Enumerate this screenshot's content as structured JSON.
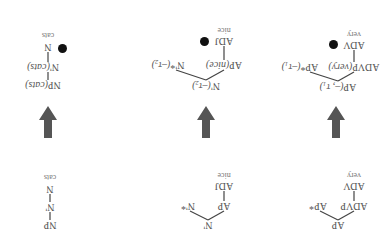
{
  "orientation": "rotated-180",
  "colors": {
    "arrow": "#555555",
    "dot": "#111111",
    "text": "#555555",
    "line": "#444444"
  },
  "top_row": {
    "tree_ap": {
      "root": "AP",
      "left": "ADVP",
      "right": "AP*",
      "mid": "ADV",
      "leaf": "very"
    },
    "tree_nbar": {
      "root": "N'",
      "left": "AP",
      "right": "N'*",
      "mid": "ADJ",
      "leaf": "nice"
    },
    "tree_np": {
      "root": "NP",
      "mid1": "N'",
      "mid2": "N",
      "leaf": "cats"
    }
  },
  "arrows": [
    {
      "direction": "down"
    },
    {
      "direction": "down"
    },
    {
      "direction": "down"
    }
  ],
  "bottom_row": {
    "tree_ap": {
      "root": "AP",
      "root_arg": "(–, τ₁)",
      "left": "ADVP",
      "left_arg": "(very)",
      "right": "AP*",
      "right_arg": "(–τ₁)",
      "mid": "ADV",
      "leaf": "very",
      "marker": "substitution-dot"
    },
    "tree_nbar": {
      "root": "N'",
      "root_arg": "(–τ₂)",
      "left": "AP",
      "left_arg": "(nice)",
      "right": "N'*",
      "right_arg": "(–τ₂)",
      "mid": "ADJ",
      "leaf": "nice",
      "marker": "substitution-dot"
    },
    "tree_np": {
      "root": "NP",
      "root_arg": "(cats)",
      "mid1": "N'",
      "mid1_arg": "(cats)",
      "mid2": "N",
      "leaf": "cats",
      "marker": "substitution-dot"
    }
  }
}
